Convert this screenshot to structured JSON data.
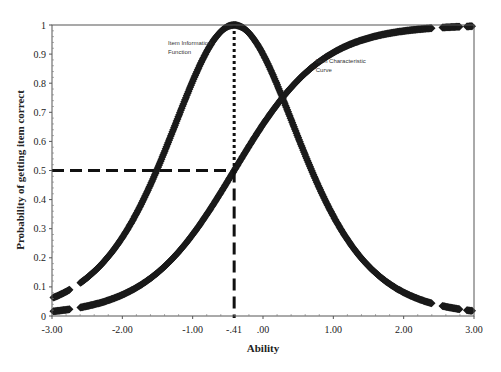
{
  "chart_data": {
    "type": "line",
    "title": "",
    "xlabel": "Ability",
    "ylabel": "Probability of getting item correct",
    "xlim": [
      -3.0,
      3.0
    ],
    "ylim": [
      0,
      1
    ],
    "x_ticks": [
      "-3.00",
      "-2.00",
      "-1.00",
      ".00",
      "1.00",
      "2.00",
      "3.00"
    ],
    "x_tick_values": [
      -3,
      -2,
      -1,
      0,
      1,
      2,
      3
    ],
    "y_ticks": [
      "0",
      "0.1",
      "0.2",
      "0.3",
      "0.4",
      "0.5",
      "0.6",
      "0.7",
      "0.8",
      "0.9",
      "1"
    ],
    "y_tick_values": [
      0,
      0.1,
      0.2,
      0.3,
      0.4,
      0.5,
      0.6,
      0.7,
      0.8,
      0.9,
      1
    ],
    "grid": false,
    "legend": null,
    "marker": "diamond",
    "item_difficulty": -0.41,
    "item_difficulty_label": "-.41",
    "discrimination_approx": 1.6,
    "series": [
      {
        "name": "Item Characteristic Curve",
        "x": [
          -3.0,
          -2.5,
          -2.0,
          -1.5,
          -1.0,
          -0.41,
          0.0,
          0.5,
          1.0,
          1.5,
          2.0,
          2.5,
          3.0
        ],
        "values": [
          0.016,
          0.034,
          0.072,
          0.145,
          0.28,
          0.5,
          0.66,
          0.81,
          0.905,
          0.955,
          0.98,
          0.99,
          0.996
        ]
      },
      {
        "name": "Item Information Function",
        "x": [
          -3.0,
          -2.5,
          -2.0,
          -1.5,
          -1.0,
          -0.41,
          0.0,
          0.5,
          1.0,
          1.5,
          2.0,
          2.5,
          3.0
        ],
        "values": [
          0.062,
          0.13,
          0.27,
          0.5,
          0.81,
          1.0,
          0.9,
          0.62,
          0.35,
          0.17,
          0.08,
          0.035,
          0.016
        ]
      }
    ],
    "annotations": [
      {
        "text_lines": [
          "Item Information",
          "Function"
        ],
        "x": -1.35,
        "y": 0.93
      },
      {
        "text_lines": [
          "Item Characteristic",
          "Curve"
        ],
        "x": 0.75,
        "y": 0.87
      },
      {
        "type": "dotted-vline",
        "x": -0.41,
        "y_from": 0.5,
        "y_to": 1.0
      },
      {
        "type": "dashed-vline",
        "x": -0.41,
        "y_from": 0,
        "y_to": 0.5
      },
      {
        "type": "dashed-hline",
        "y": 0.5,
        "x_from": -3.0,
        "x_to": -0.41
      }
    ]
  }
}
